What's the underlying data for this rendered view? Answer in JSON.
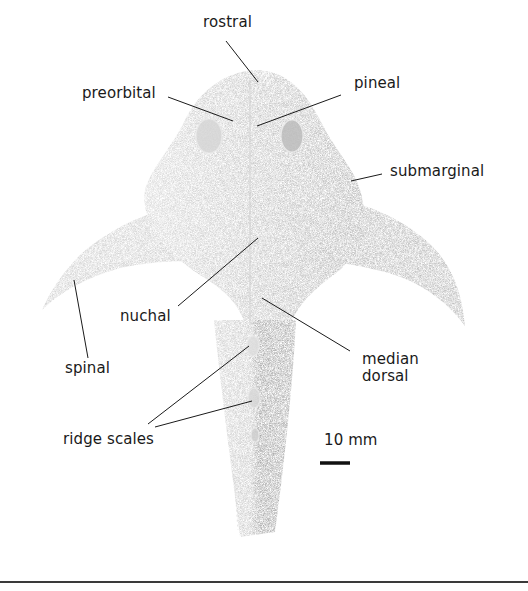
{
  "figure": {
    "labels": {
      "rostral": "rostral",
      "preorbital": "preorbital",
      "pineal": "pineal",
      "submarginal": "submarginal",
      "nuchal": "nuchal",
      "spinal": "spinal",
      "median_dorsal_line1": "median",
      "median_dorsal_line2": "dorsal",
      "ridge_scales": "ridge scales"
    },
    "scale_bar": {
      "label": "10 mm",
      "length_px": 30
    },
    "colors": {
      "ink": "#1a1a1a",
      "fossil_light": "#d9d9d9",
      "fossil_mid": "#b5b5b5",
      "fossil_dark": "#8f8f8f",
      "rule": "#3a3a3a"
    }
  }
}
